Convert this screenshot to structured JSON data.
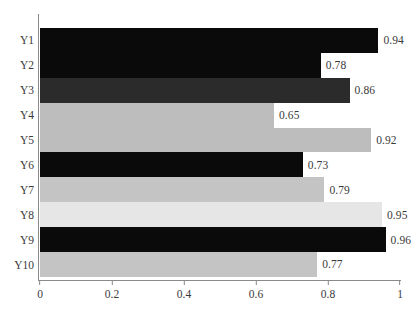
{
  "chart_data": {
    "type": "bar",
    "orientation": "horizontal",
    "title": "",
    "xlabel": "",
    "ylabel": "",
    "xlim": [
      0,
      1
    ],
    "ylim": null,
    "grid": false,
    "legend": null,
    "categories": [
      "Y1",
      "Y2",
      "Y3",
      "Y4",
      "Y5",
      "Y6",
      "Y7",
      "Y8",
      "Y9",
      "Y10"
    ],
    "values": [
      0.94,
      0.78,
      0.86,
      0.65,
      0.92,
      0.73,
      0.79,
      0.95,
      0.96,
      0.77
    ],
    "data_labels": [
      "0.94",
      "0.78",
      "0.86",
      "0.65",
      "0.92",
      "0.73",
      "0.79",
      "0.95",
      "0.96",
      "0.77"
    ],
    "bar_colors": [
      "#0a0a0a",
      "#0a0a0a",
      "#2b2b2b",
      "#bdbdbd",
      "#bdbdbd",
      "#0a0a0a",
      "#c4c4c4",
      "#e6e6e6",
      "#0a0a0a",
      "#c4c4c4"
    ],
    "xticks": [
      0,
      0.2,
      0.4,
      0.6,
      0.8,
      1
    ],
    "xtick_labels": [
      "0",
      "0.2",
      "0.4",
      "0.6",
      "0.8",
      "1"
    ],
    "ytick_labels": [
      "Y1",
      "Y2",
      "Y3",
      "Y4",
      "Y5",
      "Y6",
      "Y7",
      "Y8",
      "Y9",
      "Y10"
    ],
    "axis_color": "#8a8a8a",
    "text_color": "#3a3a3a",
    "background": "#ffffff"
  }
}
